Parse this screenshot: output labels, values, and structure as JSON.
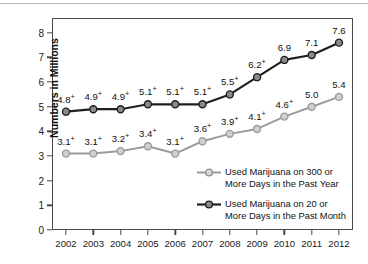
{
  "chart_data": {
    "type": "line",
    "title": "",
    "xlabel": "",
    "ylabel": "Numbers in Millions",
    "categories": [
      "2002",
      "2003",
      "2004",
      "2005",
      "2006",
      "2007",
      "2008",
      "2009",
      "2010",
      "2011",
      "2012"
    ],
    "ylim": [
      0,
      8.6
    ],
    "yticks": [
      "0",
      "1",
      "2",
      "3",
      "4",
      "5",
      "6",
      "7",
      "8"
    ],
    "grid": false,
    "legend_position": "inside-bottom-right",
    "series": [
      {
        "name": "Used Marijuana on 300 or More Days in the Past Year",
        "legend_label": "Used Marijuana on 300 or\nMore Days in the Past Year",
        "color": "#9b9b9b",
        "marker_fill": "#d0d0d0",
        "values": [
          3.1,
          3.1,
          3.2,
          3.4,
          3.1,
          3.6,
          3.9,
          4.1,
          4.6,
          5.0,
          5.4
        ],
        "labels": [
          "3.1",
          "3.1",
          "3.2",
          "3.4",
          "3.1",
          "3.6",
          "3.9",
          "4.1",
          "4.6",
          "5.0",
          "5.4"
        ],
        "significance": [
          "+",
          "+",
          "+",
          "+",
          "+",
          "+",
          "+",
          "+",
          "+",
          "",
          ""
        ]
      },
      {
        "name": "Used Marijuana on 20 or More Days in the Past Month",
        "legend_label": "Used Marijuana on 20 or\nMore Days in the Past Month",
        "color": "#1f1f1f",
        "marker_fill": "#8a8a8a",
        "values": [
          4.8,
          4.9,
          4.9,
          5.1,
          5.1,
          5.1,
          5.5,
          6.2,
          6.9,
          7.1,
          7.6
        ],
        "labels": [
          "4.8",
          "4.9",
          "4.9",
          "5.1",
          "5.1",
          "5.1",
          "5.5",
          "6.2",
          "6.9",
          "7.1",
          "7.6"
        ],
        "significance": [
          "+",
          "+",
          "+",
          "+",
          "+",
          "+",
          "+",
          "+",
          "",
          "",
          ""
        ]
      }
    ]
  }
}
